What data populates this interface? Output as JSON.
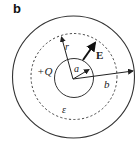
{
  "panel": {
    "label": "b"
  },
  "diagram": {
    "charge_label": "+Q",
    "field_label": "E",
    "radius_label": "r",
    "inner_radius_label": "a",
    "outer_radius_label": "b",
    "permittivity_label": "ε",
    "colors": {
      "line": "#333333",
      "background": "#ffffff"
    }
  }
}
